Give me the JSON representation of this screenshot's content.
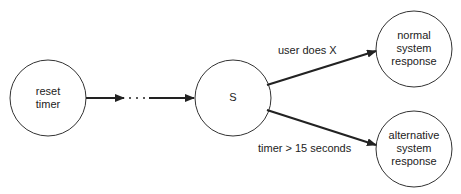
{
  "diagram": {
    "nodes": [
      {
        "id": "reset",
        "label_lines": [
          "reset",
          "timer"
        ]
      },
      {
        "id": "s",
        "label_lines": [
          "S"
        ]
      },
      {
        "id": "normal",
        "label_lines": [
          "normal",
          "system",
          "response"
        ]
      },
      {
        "id": "alternative",
        "label_lines": [
          "alternative",
          "system",
          "response"
        ]
      }
    ],
    "edges": [
      {
        "from": "reset",
        "to": "s",
        "label": "",
        "style": "arrow with ellipsis"
      },
      {
        "from": "s",
        "to": "normal",
        "label": "user does X"
      },
      {
        "from": "s",
        "to": "alternative",
        "label": "timer > 15 seconds"
      }
    ],
    "ellipsis": "· · ·"
  }
}
